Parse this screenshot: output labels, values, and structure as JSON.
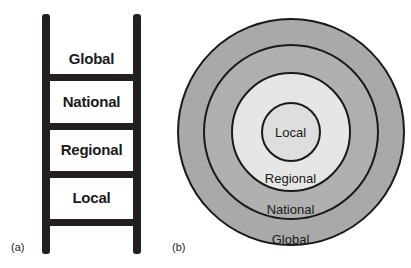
{
  "figure": {
    "name": "scale-hierarchy-diagram",
    "colors": {
      "ink": "#1a1a1a",
      "ladder_stroke": "#231f20",
      "ring_global_fill": "#a9a9a9",
      "ring_national_fill": "#b0b0b0",
      "ring_regional_fill": "#e6e6e6",
      "ring_local_fill": "#dedede",
      "background": "#ffffff"
    }
  },
  "panel_a": {
    "caption": "(a)",
    "type": "ladder",
    "steps": [
      {
        "label": "Global"
      },
      {
        "label": "National"
      },
      {
        "label": "Regional"
      },
      {
        "label": "Local"
      }
    ]
  },
  "panel_b": {
    "caption": "(b)",
    "type": "concentric-circles",
    "rings": [
      {
        "label": "Global"
      },
      {
        "label": "National"
      },
      {
        "label": "Regional"
      },
      {
        "label": "Local"
      }
    ]
  },
  "chart_data": {
    "type": "diagram",
    "title": "",
    "panels": [
      {
        "id": "a",
        "caption": "(a)",
        "representation": "ladder",
        "levels_top_to_bottom": [
          "Global",
          "National",
          "Regional",
          "Local"
        ]
      },
      {
        "id": "b",
        "caption": "(b)",
        "representation": "nested concentric circles",
        "levels_outer_to_inner": [
          "Global",
          "National",
          "Regional",
          "Local"
        ]
      }
    ]
  }
}
